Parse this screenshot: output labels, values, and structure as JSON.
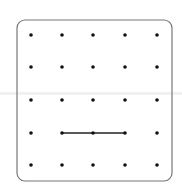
{
  "geoboard": {
    "rows": 5,
    "cols": 5,
    "dot_x": [
      31,
      62,
      93,
      125,
      157
    ],
    "dot_y": [
      35,
      67,
      100,
      133,
      165
    ],
    "border": {
      "x": 17,
      "y": 20,
      "width": 155,
      "height": 161,
      "radius": 8,
      "color": "#777777"
    },
    "dot_color": "#111111",
    "segments": [
      {
        "from": {
          "row": 3,
          "col": 1
        },
        "to": {
          "row": 3,
          "col": 3
        },
        "color": "#222222"
      }
    ]
  }
}
